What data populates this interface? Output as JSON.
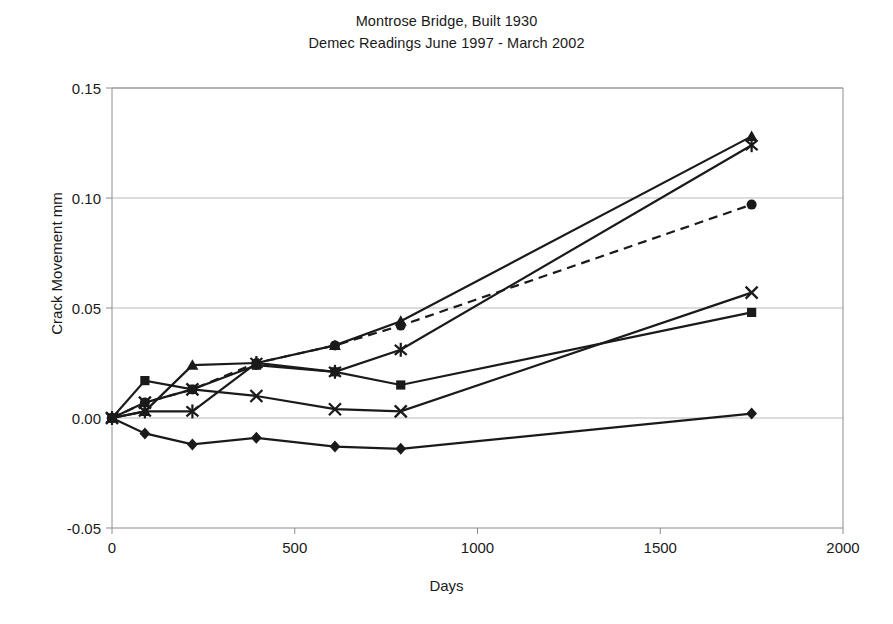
{
  "chart_data": {
    "type": "line",
    "title": "Montrose Bridge, Built 1930",
    "subtitle": "Demec Readings June 1997 - March 2002",
    "xlabel": "Days",
    "ylabel": "Crack Movement mm",
    "xlim": [
      0,
      2000
    ],
    "ylim": [
      -0.05,
      0.15
    ],
    "xticks": [
      0,
      500,
      1000,
      1500,
      2000
    ],
    "xticklabels": [
      "0",
      "500",
      "1000",
      "1500",
      "2000"
    ],
    "yticks": [
      -0.05,
      0.0,
      0.05,
      0.1,
      0.15
    ],
    "yticklabels": [
      "-0.05",
      "0.00",
      "0.05",
      "0.10",
      "0.15"
    ],
    "grid": "horizontal",
    "legend": "none",
    "x": [
      0,
      90,
      220,
      395,
      610,
      790,
      1750
    ],
    "series": [
      {
        "name": "Gauge 1",
        "marker": "diamond",
        "linestyle": "solid",
        "values": [
          0.0,
          -0.007,
          -0.012,
          -0.009,
          -0.013,
          -0.014,
          0.002
        ]
      },
      {
        "name": "Gauge 2",
        "marker": "square",
        "linestyle": "solid",
        "values": [
          0.0,
          0.017,
          0.013,
          0.024,
          0.021,
          0.015,
          0.048
        ]
      },
      {
        "name": "Gauge 3",
        "marker": "triangle",
        "linestyle": "solid",
        "values": [
          0.0,
          0.003,
          0.024,
          0.025,
          0.033,
          0.044,
          0.128
        ]
      },
      {
        "name": "Gauge 4",
        "marker": "cross",
        "linestyle": "solid",
        "values": [
          0.0,
          0.007,
          0.013,
          0.01,
          0.004,
          0.003,
          0.057
        ]
      },
      {
        "name": "Gauge 5",
        "marker": "asterisk",
        "linestyle": "solid",
        "values": [
          0.0,
          0.003,
          0.003,
          0.025,
          0.021,
          0.031,
          0.124
        ]
      },
      {
        "name": "Gauge 6",
        "marker": "circle",
        "linestyle": "dashed",
        "values": [
          0.0,
          0.007,
          0.013,
          0.025,
          0.033,
          0.042,
          0.097
        ]
      }
    ]
  },
  "colors": {
    "ink": "#1a1a1a",
    "grid": "#b9b9b9",
    "frame": "#8c8c8c"
  }
}
